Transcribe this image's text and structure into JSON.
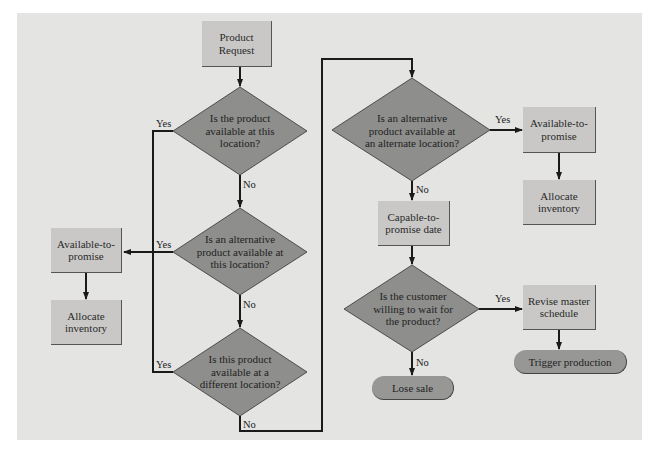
{
  "colors": {
    "background": "#e4e4e2",
    "process_box": "#c9c8c6",
    "decision": "#8e8e8c",
    "terminal": "#979796",
    "line": "#1a1a1a"
  },
  "nodes": {
    "start": {
      "label": "Product Request"
    },
    "d1": {
      "label": "Is the product available at this location?"
    },
    "d2": {
      "label": "Is an alternative product available at this location?"
    },
    "d3": {
      "label": "Is this product available at a different location?"
    },
    "d4": {
      "label": "Is an alternative product available at an alternate location?"
    },
    "d5": {
      "label": "Is the customer willing to wait for the product?"
    },
    "atp_left": {
      "label": "Available-to-promise"
    },
    "alloc_left": {
      "label": "Allocate inventory"
    },
    "atp_right": {
      "label": "Available-to-promise"
    },
    "alloc_right": {
      "label": "Allocate inventory"
    },
    "ctp": {
      "label": "Capable-to-promise date"
    },
    "revise": {
      "label": "Revise master schedule"
    },
    "trigger": {
      "label": "Trigger production"
    },
    "lose": {
      "label": "Lose sale"
    }
  },
  "edge_labels": {
    "d1_yes": "Yes",
    "d1_no": "No",
    "d2_yes": "Yes",
    "d2_no": "No",
    "d3_yes": "Yes",
    "d3_no": "No",
    "d4_yes": "Yes",
    "d4_no": "No",
    "d5_yes": "Yes",
    "d5_no": "No"
  }
}
